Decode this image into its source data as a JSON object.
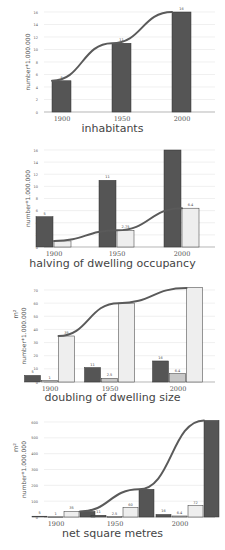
{
  "colors": {
    "dark_bar": "#555555",
    "mid_bar": "#c8c8c8",
    "light_bar": "#eeeeee",
    "curve": "#5a5a5a",
    "grid": "#e6e6e6",
    "axis_text": "#555555"
  },
  "chart_data": [
    {
      "type": "bar",
      "title": "inhabitants",
      "xlabel": "",
      "ylabel": "number*1.000.000",
      "ylim": [
        0,
        16
      ],
      "yticks": [
        0,
        2,
        4,
        6,
        8,
        10,
        12,
        14,
        16
      ],
      "categories": [
        "1900",
        "1950",
        "2000"
      ],
      "series": [
        {
          "name": "inhabitants",
          "color": "dark",
          "values": [
            5,
            11,
            16
          ],
          "labels": [
            "5",
            "11",
            "16"
          ]
        }
      ],
      "trend_line": true,
      "grid": true
    },
    {
      "type": "bar",
      "title": "halving of dwelling occupancy",
      "xlabel": "",
      "ylabel": "number*1.000.000",
      "ylim": [
        0,
        16
      ],
      "yticks": [
        0,
        2,
        4,
        6,
        8,
        10,
        12,
        14,
        16
      ],
      "categories": [
        "1900",
        "1950",
        "2000"
      ],
      "series": [
        {
          "name": "inhabitants",
          "color": "dark",
          "values": [
            5,
            11,
            16
          ],
          "labels": [
            "5",
            "11",
            ""
          ]
        },
        {
          "name": "dwellings",
          "color": "light",
          "values": [
            1,
            2.75,
            6.4
          ],
          "labels": [
            "",
            "2.75",
            "6.4"
          ]
        }
      ],
      "trend_line": true,
      "grid": true
    },
    {
      "type": "bar",
      "title": "doubling of dwelling size",
      "xlabel": "",
      "ylabel": "m² number*1.000.000",
      "ylim": [
        0,
        70
      ],
      "yticks": [
        0,
        10,
        20,
        30,
        40,
        50,
        60,
        70
      ],
      "categories": [
        "1900",
        "1950",
        "2000"
      ],
      "series": [
        {
          "name": "inhabitants",
          "color": "dark",
          "values": [
            5,
            11,
            16
          ],
          "labels": [
            "5",
            "11",
            "16"
          ]
        },
        {
          "name": "dwellings",
          "color": "mid",
          "values": [
            1,
            2.75,
            6.4
          ],
          "labels": [
            "1",
            "2.5",
            "6.4"
          ]
        },
        {
          "name": "dwelling size m²",
          "color": "light",
          "values": [
            35,
            60,
            72
          ],
          "labels": [
            "35",
            "",
            ""
          ]
        }
      ],
      "trend_line": true,
      "grid": true
    },
    {
      "type": "bar",
      "title": "net square metres",
      "xlabel": "",
      "ylabel": "m² number*1.000.000",
      "ylim": [
        0,
        600
      ],
      "yticks": [
        0,
        100,
        200,
        300,
        400,
        500,
        600
      ],
      "categories": [
        "1900",
        "1950",
        "2000"
      ],
      "series": [
        {
          "name": "inhabitants",
          "color": "dark",
          "values": [
            5,
            11,
            16
          ],
          "labels": [
            "5",
            "11",
            "16"
          ]
        },
        {
          "name": "dwellings",
          "color": "mid",
          "values": [
            1,
            2.75,
            6.4
          ],
          "labels": [
            "1",
            "2.5",
            "6.4"
          ]
        },
        {
          "name": "dwelling size m²",
          "color": "light",
          "values": [
            35,
            60,
            72
          ],
          "labels": [
            "35",
            "60",
            "72"
          ]
        },
        {
          "name": "net square metres",
          "color": "dark",
          "values": [
            35,
            175,
            610
          ],
          "labels": [
            "",
            "",
            ""
          ]
        }
      ],
      "trend_line": true,
      "grid": true
    }
  ]
}
